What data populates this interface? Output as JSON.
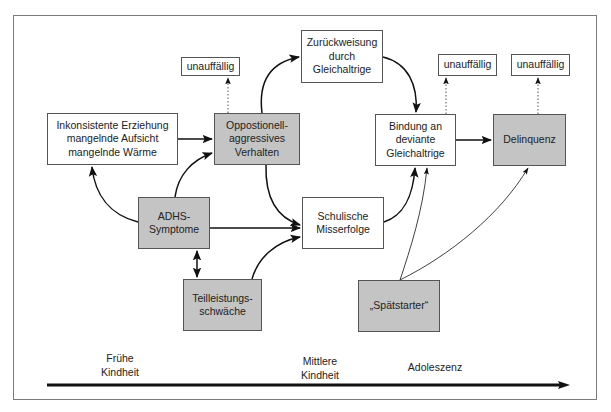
{
  "diagram": {
    "nodes": {
      "inconsistent": {
        "label": "Inkonsistente Erziehung\nmangelnde Aufsicht\nmangelnde Wärme",
        "shaded": false
      },
      "oppositional": {
        "label": "Oppostionell-\naggressives\nVerhalten",
        "shaded": true
      },
      "unremarkable_1": {
        "label": "unauffällig",
        "shaded": false
      },
      "rejection": {
        "label": "Zurückweisung\ndurch\nGleichaltrige",
        "shaded": false
      },
      "unremarkable_2": {
        "label": "unauffällig",
        "shaded": false
      },
      "unremarkable_3": {
        "label": "unauffällig",
        "shaded": false
      },
      "deviant_peers": {
        "label": "Bindung an\ndeviante\nGleichaltrige",
        "shaded": false
      },
      "delinquency": {
        "label": "Delinquenz",
        "shaded": true
      },
      "adhd": {
        "label": "ADHS-\nSymptome",
        "shaded": true
      },
      "school_failure": {
        "label": "Schulische\nMisserfolge",
        "shaded": false
      },
      "learning_disorder": {
        "label": "Teilleistungs-\nschwäche",
        "shaded": true
      },
      "late_starter": {
        "label": "„Spätstarter“",
        "shaded": true
      }
    },
    "edges": [
      {
        "from": "inconsistent",
        "to": "oppositional",
        "style": "solid"
      },
      {
        "from": "adhd",
        "to": "inconsistent",
        "style": "solid-curved"
      },
      {
        "from": "adhd",
        "to": "oppositional",
        "style": "solid-curved"
      },
      {
        "from": "adhd",
        "to": "school_failure",
        "style": "solid"
      },
      {
        "from": "adhd",
        "to": "learning_disorder",
        "style": "bidirectional"
      },
      {
        "from": "learning_disorder",
        "to": "school_failure",
        "style": "solid-curved"
      },
      {
        "from": "oppositional",
        "to": "unremarkable_1",
        "style": "dotted"
      },
      {
        "from": "oppositional",
        "to": "rejection",
        "style": "solid-curved"
      },
      {
        "from": "oppositional",
        "to": "school_failure",
        "style": "solid-curved"
      },
      {
        "from": "rejection",
        "to": "deviant_peers",
        "style": "solid-curved"
      },
      {
        "from": "school_failure",
        "to": "deviant_peers",
        "style": "solid-curved"
      },
      {
        "from": "deviant_peers",
        "to": "unremarkable_2",
        "style": "dotted"
      },
      {
        "from": "deviant_peers",
        "to": "delinquency",
        "style": "solid"
      },
      {
        "from": "delinquency",
        "to": "unremarkable_3",
        "style": "dotted"
      },
      {
        "from": "late_starter",
        "to": "deviant_peers",
        "style": "thin-curved"
      },
      {
        "from": "late_starter",
        "to": "delinquency",
        "style": "thin-curved"
      }
    ],
    "timeline": {
      "stages": [
        "Frühe\nKindheit",
        "Mittlere\nKindheit",
        "Adoleszenz"
      ]
    },
    "colors": {
      "shaded_fill": "#c4c4c4",
      "stroke": "#111111",
      "frame": "#7a7a7a"
    }
  }
}
